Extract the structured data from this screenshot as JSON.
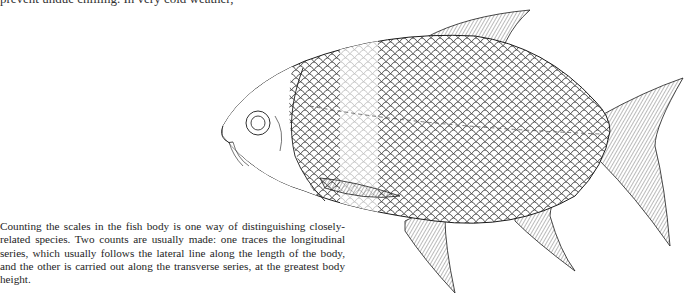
{
  "page": {
    "top_line_text": "prevent undue chilling. In very cold weather,",
    "top_line_faded_text": "",
    "caption": "Counting the scales in the fish body is one way of distinguishing closely-related species. Two counts are usually made: one traces the longitudinal series, which usually follows the lateral line along the length of the body, and the other is carried out along the transverse series, at the greatest body height."
  },
  "illustration": {
    "subject": "fish-line-drawing",
    "description": "Line drawing of a deep-bodied cyprinid fish facing left, scales drawn, lateral line dashed, a lighter band of scales marking the transverse series",
    "colors": {
      "ink": "#1a1a1a",
      "faded_scales": "#b5b5b5",
      "paper": "#ffffff"
    }
  }
}
